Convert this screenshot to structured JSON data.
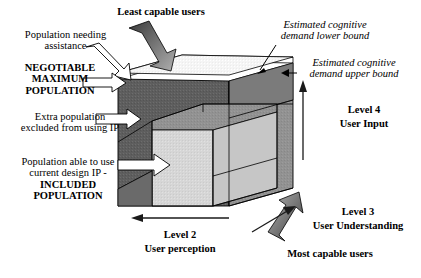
{
  "diagram": {
    "type": "3d-cube-annotated",
    "colors": {
      "outer_shell_dark": "#5e5e5e",
      "outer_top_light": "#f4f4f4",
      "inner_block_light": "#d4d4d4",
      "right_face_mid": "#8f8f8f",
      "right_face_inner": "#c9c9c9",
      "solid_arrow_dark": "#3a3a3a",
      "solid_arrow_light": "#a8a8a8",
      "outline_arrow_fill": "#ffffff",
      "stroke": "#000000"
    }
  },
  "labels": {
    "least_capable_users": "Least capable users",
    "population_needing_assistance": "Population needing\nassistance",
    "negotiable_maximum_population": "NEGOTIABLE\nMAXIMUM\nPOPULATION",
    "extra_population_excluded": "Extra population\nexcluded from using IP",
    "population_able_to_use": "Population able to use\ncurrent design IP -",
    "included_population": "INCLUDED\nPOPULATION",
    "estimated_lower_bound": "Estimated cognitive\ndemand lower bound",
    "estimated_upper_bound": "Estimated cognitive\ndemand upper bound",
    "level4": "Level 4",
    "level4_sub": "User Input",
    "level3": "Level 3",
    "level3_sub": "User Understanding",
    "level2": "Level 2",
    "level2_sub": "User perception",
    "most_capable_users": "Most capable users"
  },
  "label_lines": {
    "population_needing_assistance_l1": "Population needing",
    "population_needing_assistance_l2": "assistance",
    "negotiable_l1": "NEGOTIABLE",
    "negotiable_l2": "MAXIMUM",
    "negotiable_l3": "POPULATION",
    "extra_l1": "Extra population",
    "extra_l2": "excluded from using IP",
    "able_l1": "Population able to use",
    "able_l2": "current design IP -",
    "able_l3": "INCLUDED",
    "able_l4": "POPULATION",
    "lower_l1": "Estimated cognitive",
    "lower_l2": "demand lower bound",
    "upper_l1": "Estimated cognitive",
    "upper_l2": "demand upper bound"
  },
  "axes": {
    "vertical": {
      "name": "Level 4",
      "sub": "User Input",
      "direction": "up"
    },
    "depth": {
      "name": "Level 3",
      "sub": "User Understanding",
      "direction": "up-right"
    },
    "horizontal": {
      "name": "Level 2",
      "sub": "User perception",
      "direction": "left"
    }
  },
  "capability_markers": {
    "top_left": "Least capable users",
    "bottom_right": "Most capable users"
  }
}
